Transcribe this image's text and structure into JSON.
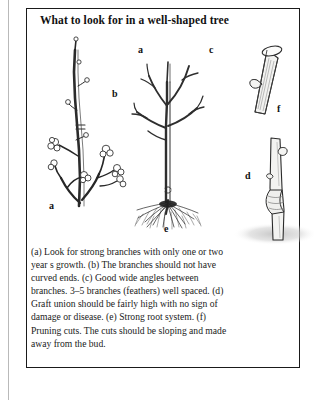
{
  "page": {
    "title": "What to look for in a well-shaped tree",
    "background_color": "#ffffff",
    "frame_color": "#1a1a1a",
    "ink_color": "#222222",
    "shadow_color": "#c9c9c9"
  },
  "figure": {
    "name": "well-shaped-tree-diagram",
    "panels": [
      {
        "id": "left-branch",
        "name": "branch-with-buds-illustration",
        "label": "a",
        "description": "Strong branch with clustered fruit buds at tips"
      },
      {
        "id": "center-tree",
        "name": "whole-tree-illustration",
        "labels": [
          "a",
          "b",
          "c",
          "e"
        ],
        "description": "Young whole tree with feathered branches and fibrous root system"
      },
      {
        "id": "pruning-cut",
        "name": "pruning-cut-illustration",
        "label": "f",
        "description": "Stem section with sloping pruning cut above a bud"
      },
      {
        "id": "graft-union",
        "name": "graft-union-illustration",
        "label": "d",
        "description": "Stem showing graft union set high above soil level"
      }
    ],
    "labels": {
      "a_left": "a",
      "a_center": "a",
      "b_center": "b",
      "c_center": "c",
      "e_center": "e",
      "f_right": "f",
      "d_right": "d"
    }
  },
  "caption": {
    "text": "(a) Look for strong branches with only one or two year s growth. (b) The branches should not have curved ends. (c) Good wide angles between branches. 3–5 branches (feathers) well spaced. (d) Graft union should be fairly high with no sign of damage or disease. (e) Strong root system. (f) Pruning cuts. The cuts should be sloping and made away from the bud.",
    "items": [
      {
        "key": "(a)",
        "text": "Look for strong branches with only one or two year s growth."
      },
      {
        "key": "(b)",
        "text": "The branches should not have curved ends."
      },
      {
        "key": "(c)",
        "text": "Good wide angles between branches. 3–5 branches (feathers) well spaced."
      },
      {
        "key": "(d)",
        "text": "Graft union should be fairly high with no sign of damage or disease."
      },
      {
        "key": "(e)",
        "text": "Strong root system."
      },
      {
        "key": "(f)",
        "text": "Pruning cuts. The cuts should be sloping and made away from the bud."
      }
    ]
  }
}
